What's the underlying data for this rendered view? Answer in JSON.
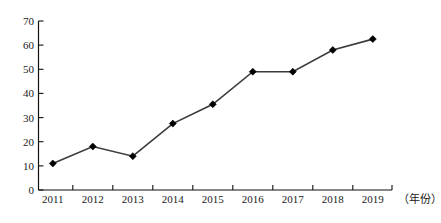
{
  "chart_data": {
    "type": "line",
    "title": "",
    "xlabel": "（年份）",
    "ylabel": "",
    "categories": [
      "2011",
      "2012",
      "2013",
      "2014",
      "2015",
      "2016",
      "2017",
      "2018",
      "2019"
    ],
    "values": [
      11,
      18,
      14,
      27.5,
      35.5,
      49,
      49,
      58,
      62.5
    ],
    "series": [
      {
        "name": "",
        "values": [
          11,
          18,
          14,
          27.5,
          35.5,
          49,
          49,
          58,
          62.5
        ]
      }
    ],
    "ylim": [
      0,
      70
    ],
    "yticks": [
      0,
      10,
      20,
      30,
      40,
      50,
      60,
      70
    ],
    "ytick_labels": [
      "0",
      "10",
      "20",
      "30",
      "40",
      "50",
      "60",
      "70"
    ],
    "xtick_labels": [
      "2011",
      "2012",
      "2013",
      "2014",
      "2015",
      "2016",
      "2017",
      "2018",
      "2019"
    ],
    "grid": false,
    "legend": null,
    "legend_position": "none",
    "marker": "diamond",
    "line_color": "#3b3b3b",
    "marker_color": "#000000",
    "axis_color": "#111111",
    "background": "#ffffff"
  },
  "axis": {
    "x_caption": "（年份）"
  }
}
